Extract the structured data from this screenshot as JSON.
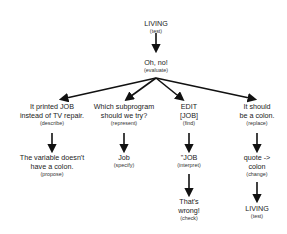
{
  "diagram": {
    "nodes": [
      {
        "id": "living1",
        "label": "LIVING",
        "sub": "(test)"
      },
      {
        "id": "ohno",
        "label": "Oh, no!",
        "sub": "(evaluate)"
      },
      {
        "id": "printed",
        "label_lines": [
          "It printed JOB",
          "instead of TV repair."
        ],
        "sub": "(describe)"
      },
      {
        "id": "which",
        "label_lines": [
          "Which subprogram",
          "should we try?"
        ],
        "sub": "(represent)"
      },
      {
        "id": "edit",
        "label_lines": [
          "EDIT",
          "[JOB]"
        ],
        "sub": "(find)"
      },
      {
        "id": "should",
        "label_lines": [
          "It should",
          "be a colon."
        ],
        "sub": "(replace)"
      },
      {
        "id": "variable",
        "label_lines": [
          "The variable doesn't",
          "have a colon."
        ],
        "sub": "(propose)"
      },
      {
        "id": "job",
        "label": "Job",
        "sub": "(specify)"
      },
      {
        "id": "quotejob",
        "label": "\"JOB",
        "sub": "(interpret)"
      },
      {
        "id": "quote",
        "label_lines": [
          "quote ->",
          "colon"
        ],
        "sub": "(change)"
      },
      {
        "id": "wrong",
        "label_lines": [
          "That's",
          "wrong!"
        ],
        "sub": "(check)"
      },
      {
        "id": "living2",
        "label": "LIVING",
        "sub": "(test)"
      }
    ],
    "edges": [
      [
        "living1",
        "ohno"
      ],
      [
        "ohno",
        "printed"
      ],
      [
        "ohno",
        "which"
      ],
      [
        "ohno",
        "edit"
      ],
      [
        "ohno",
        "should"
      ],
      [
        "printed",
        "variable"
      ],
      [
        "which",
        "job"
      ],
      [
        "edit",
        "quotejob"
      ],
      [
        "quotejob",
        "wrong"
      ],
      [
        "should",
        "quote"
      ],
      [
        "quote",
        "living2"
      ]
    ]
  }
}
